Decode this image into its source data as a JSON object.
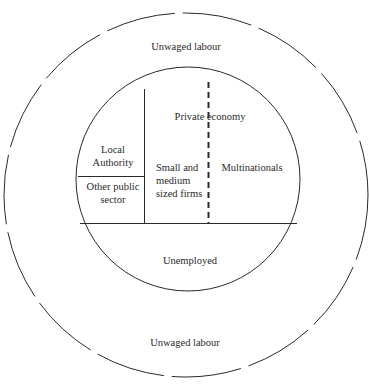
{
  "diagram": {
    "outer_ring": {
      "top_label": "Unwaged labour",
      "bottom_label": "Unwaged labour"
    },
    "inner_circle": {
      "sections": {
        "local_authority": "Local Authority",
        "other_public_sector": "Other public sector",
        "private_economy": "Private economy",
        "small_medium_firms": "Small and medium sized firms",
        "multinationals": "Multinationals",
        "unemployed": "Unemployed"
      }
    },
    "colors": {
      "line": "#2a2a2a",
      "background": "#ffffff"
    }
  }
}
